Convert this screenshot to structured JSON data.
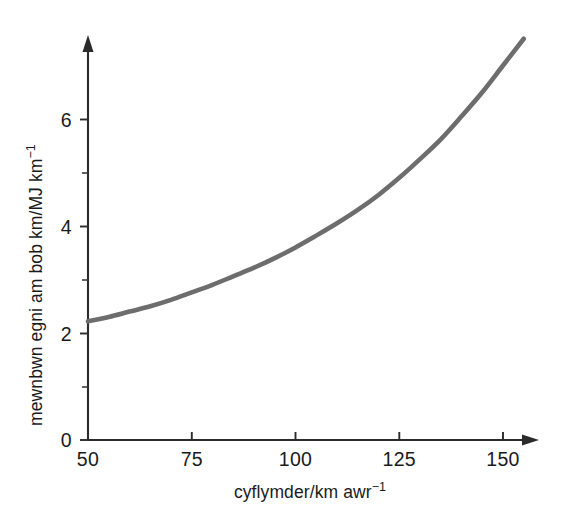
{
  "chart_data": {
    "type": "line",
    "title": "",
    "subtitle": "",
    "xlabel": "cyflymder/km awr",
    "xlabel_sup": "−1",
    "ylabel": "mewnbwn egni am bob km/MJ km",
    "ylabel_sup": "−1",
    "xlim": [
      50,
      156
    ],
    "ylim": [
      0,
      7.6
    ],
    "grid": false,
    "legend": null,
    "xticks": [
      50,
      75,
      100,
      125,
      150
    ],
    "xtick_labels": [
      "50",
      "75",
      "100",
      "125",
      "150"
    ],
    "yticks": [
      0,
      2,
      4,
      6
    ],
    "ytick_labels": [
      "0",
      "2",
      "4",
      "6"
    ],
    "yticks_minor": [
      1,
      3,
      5
    ],
    "axis_arrows": true,
    "series": [
      {
        "name": "energy input per km",
        "color": "#6d6d6d",
        "x": [
          50,
          55,
          60,
          65,
          70,
          75,
          80,
          85,
          90,
          95,
          100,
          105,
          110,
          115,
          120,
          125,
          130,
          135,
          140,
          145,
          150,
          155
        ],
        "y": [
          2.22,
          2.3,
          2.4,
          2.5,
          2.62,
          2.76,
          2.9,
          3.06,
          3.22,
          3.4,
          3.6,
          3.82,
          4.05,
          4.3,
          4.58,
          4.9,
          5.25,
          5.62,
          6.05,
          6.5,
          7.0,
          7.5
        ]
      }
    ],
    "annotations": []
  },
  "colors": {
    "background": "#ffffff",
    "axis": "#2b2b2b",
    "curve": "#6d6d6d",
    "text": "#1a1a1a"
  },
  "geometry": {
    "x_axis_y_px": 440,
    "y_axis_x_px": 88,
    "px_per_x_unit": 4.15,
    "px_per_y_unit": 53.5,
    "x_arrow_tip_px": 536,
    "y_arrow_tip_px": 38
  }
}
